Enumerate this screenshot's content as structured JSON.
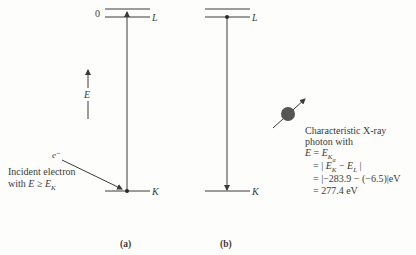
{
  "diagram_a": {
    "zero_label": "0",
    "L_label": "L",
    "K_label": "K",
    "energy_axis_label": "E",
    "electron_label": "e⁻",
    "incident_line1": "Incident electron",
    "incident_line2_prefix": "with ",
    "incident_line2_E": "E",
    "incident_line2_op": " ≥ ",
    "incident_line2_EK": "E",
    "incident_line2_EK_sub": "K",
    "panel_label": "(a)"
  },
  "diagram_b": {
    "L_label": "L",
    "K_label": "K",
    "panel_label": "(b)"
  },
  "photon": {
    "line1": "Characteristic X-ray",
    "line2": "photon with",
    "line3_E": "E",
    "line3_eq": " = ",
    "line3_EK": "E",
    "line3_EK_sub": "K",
    "line3_EK_subsub": "α",
    "line4_prefix": "= | ",
    "line4_EK": "E",
    "line4_EK_sub": "K",
    "line4_minus": " − ",
    "line4_EL": "E",
    "line4_EL_sub": "L",
    "line4_suffix": " |",
    "line5": "= |−283.9 − (−6.5)|eV",
    "line6": "= 277.4 eV"
  },
  "colors": {
    "line": "#3a3a3a",
    "photon_fill": "#555555",
    "background": "#fdfdfb"
  }
}
